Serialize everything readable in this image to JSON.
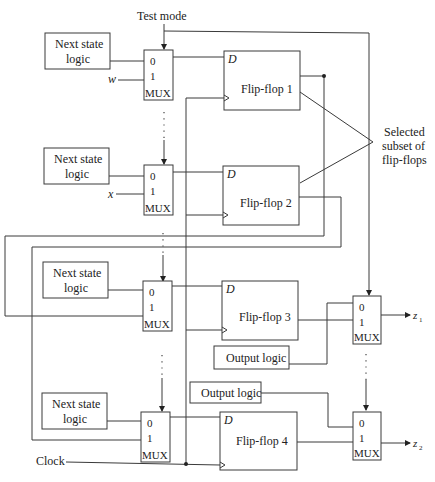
{
  "diagram": {
    "test_mode_label": "Test mode",
    "clock_label": "Clock",
    "annotation": [
      "Selected",
      "subset of",
      "flip-flops"
    ],
    "next_state_logic": [
      [
        "Next state",
        "logic"
      ],
      [
        "Next state",
        "logic"
      ],
      [
        "Next state",
        "logic"
      ],
      [
        "Next state",
        "logic"
      ]
    ],
    "flip_flops": [
      "Flip-flop 1",
      "Flip-flop 2",
      "Flip-flop 3",
      "Flip-flop 4"
    ],
    "d_label": "D",
    "mux_label": "MUX",
    "mux_input_0": "0",
    "mux_input_1": "1",
    "inputs": [
      "w",
      "x"
    ],
    "output_logic": [
      "Output logic",
      "Output logic"
    ],
    "outputs": [
      "z",
      "z"
    ],
    "output_subscripts": [
      "1",
      "2"
    ]
  }
}
